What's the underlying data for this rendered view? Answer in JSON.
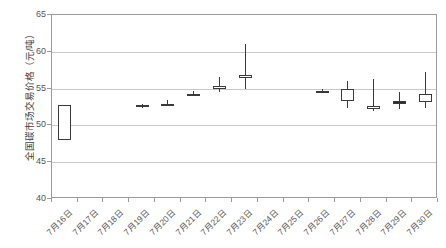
{
  "chart_data": {
    "type": "candlestick",
    "title": "",
    "xlabel": "",
    "ylabel": "全国碳市场交易价格（元/吨）",
    "ylim": [
      40,
      65
    ],
    "yticks": [
      40,
      45,
      50,
      55,
      60,
      65
    ],
    "grid": true,
    "legend": "none",
    "categories": [
      "7月16日",
      "7月17日",
      "7月18日",
      "7月19日",
      "7月20日",
      "7月21日",
      "7月22日",
      "7月23日",
      "7月24日",
      "7月25日",
      "7月26日",
      "7月27日",
      "7月28日",
      "7月29日",
      "7月30日"
    ],
    "series_name": "全国碳市场交易价格",
    "points": [
      {
        "date": "7月16日",
        "open": 52.78,
        "high": 52.8,
        "low": 48.0,
        "close": 48.0,
        "direction": "down",
        "body": "hollow"
      },
      {
        "date": "7月17日",
        "open": null,
        "high": null,
        "low": null,
        "close": null,
        "direction": "none",
        "body": "none"
      },
      {
        "date": "7月18日",
        "open": null,
        "high": null,
        "low": null,
        "close": null,
        "direction": "none",
        "body": "none"
      },
      {
        "date": "7月19日",
        "open": 52.78,
        "high": 52.92,
        "low": 52.32,
        "close": 52.45,
        "direction": "down",
        "body": "filled"
      },
      {
        "date": "7月20日",
        "open": 52.92,
        "high": 53.42,
        "low": 52.8,
        "close": 52.8,
        "direction": "down",
        "body": "hollow"
      },
      {
        "date": "7月21日",
        "open": 54.3,
        "high": 54.7,
        "low": 54.1,
        "close": 54.22,
        "direction": "down",
        "body": "hollow"
      },
      {
        "date": "7月22日",
        "open": 55.3,
        "high": 56.52,
        "low": 54.6,
        "close": 55.2,
        "direction": "down",
        "body": "hollow"
      },
      {
        "date": "7月23日",
        "open": 56.8,
        "high": 61.07,
        "low": 55.0,
        "close": 56.4,
        "direction": "down",
        "body": "hollow"
      },
      {
        "date": "7月24日",
        "open": null,
        "high": null,
        "low": null,
        "close": null,
        "direction": "none",
        "body": "none"
      },
      {
        "date": "7月25日",
        "open": null,
        "high": null,
        "low": null,
        "close": null,
        "direction": "none",
        "body": "none"
      },
      {
        "date": "7月26日",
        "open": 54.72,
        "high": 54.9,
        "low": 54.55,
        "close": 54.7,
        "direction": "flat",
        "body": "filled"
      },
      {
        "date": "7月27日",
        "open": 53.3,
        "high": 56.0,
        "low": 52.3,
        "close": 55.0,
        "direction": "up",
        "body": "hollow"
      },
      {
        "date": "7月28日",
        "open": 52.3,
        "high": 56.3,
        "low": 52.0,
        "close": 52.6,
        "direction": "up",
        "body": "hollow"
      },
      {
        "date": "7月29日",
        "open": 53.3,
        "high": 54.6,
        "low": 52.2,
        "close": 53.3,
        "direction": "flat",
        "body": "filled"
      },
      {
        "date": "7月30日",
        "open": 53.2,
        "high": 57.3,
        "low": 52.3,
        "close": 54.3,
        "direction": "up",
        "body": "hollow"
      }
    ]
  },
  "axis": {
    "y_label": "全国碳市场交易价格（元/吨）",
    "y_tick_labels": [
      "65",
      "60",
      "55",
      "50",
      "45",
      "40"
    ],
    "x_tick_labels": [
      "7月16日",
      "7月17日",
      "7月18日",
      "7月19日",
      "7月20日",
      "7月21日",
      "7月22日",
      "7月23日",
      "7月24日",
      "7月25日",
      "7月26日",
      "7月27日",
      "7月28日",
      "7月29日",
      "7月30日"
    ]
  }
}
